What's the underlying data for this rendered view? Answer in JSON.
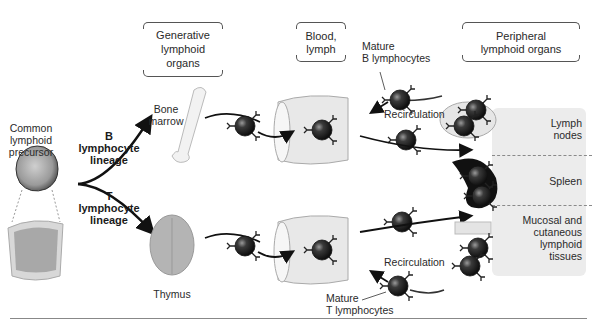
{
  "headers": {
    "generative": "Generative lymphoid organs",
    "generative_lines": [
      "Generative",
      "lymphoid",
      "organs"
    ],
    "blood": [
      "Blood,",
      "lymph"
    ],
    "peripheral": [
      "Peripheral",
      "lymphoid organs"
    ]
  },
  "precursor": {
    "lines": [
      "Common",
      "lymphoid",
      "precursor"
    ]
  },
  "lineages": {
    "b": [
      "B",
      "lymphocyte",
      "lineage"
    ],
    "t": [
      "T",
      "lymphocyte",
      "lineage"
    ]
  },
  "organs": {
    "bone_marrow": [
      "Bone",
      "marrow"
    ],
    "thymus": "Thymus"
  },
  "mature": {
    "b": [
      "Mature",
      "B lymphocytes"
    ],
    "t": [
      "Mature",
      "T lymphocytes"
    ]
  },
  "recirculation": {
    "top": "Recirculation",
    "bottom": "Recirculation"
  },
  "peripheral_organs": {
    "lymph_nodes": [
      "Lymph",
      "nodes"
    ],
    "spleen": "Spleen",
    "mucosal": [
      "Mucosal and",
      "cutaneous",
      "lymphoid",
      "tissues"
    ]
  },
  "colors": {
    "cell": "#2b2b2b",
    "panel": "#ececec",
    "arrow": "#111111",
    "vessel": "#e6e6e6"
  }
}
